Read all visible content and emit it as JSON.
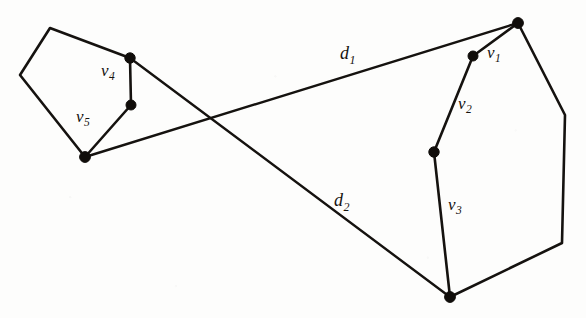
{
  "figure": {
    "background_color": "#fdfdfc",
    "ink_color": "#15120f",
    "width": 586,
    "height": 318
  },
  "chart_data": {
    "type": "diagram",
    "xlabel": "",
    "ylabel": "",
    "grid": false,
    "legend": "none",
    "xlim": [
      0,
      586
    ],
    "ylim": [
      0,
      318
    ],
    "shapes": [
      {
        "name": "left-polygon",
        "kind": "polygon",
        "closed": true,
        "points": [
          [
            50,
            28
          ],
          [
            130,
            58
          ],
          [
            131,
            105
          ],
          [
            85,
            157
          ],
          [
            20,
            75
          ]
        ]
      },
      {
        "name": "right-polygon",
        "kind": "polygon",
        "closed": true,
        "points": [
          [
            518,
            23
          ],
          [
            473,
            56
          ],
          [
            434,
            152
          ],
          [
            450,
            297
          ],
          [
            562,
            243
          ],
          [
            565,
            115
          ]
        ]
      }
    ],
    "segments": [
      {
        "name": "distance-line-d1",
        "label": "d1",
        "from": [
          85,
          157
        ],
        "to": [
          518,
          23
        ]
      },
      {
        "name": "distance-line-d2",
        "label": "d2",
        "from": [
          130,
          58
        ],
        "to": [
          450,
          297
        ]
      }
    ],
    "vertex_markers": [
      {
        "name": "marker-top-right",
        "point": [
          518,
          23
        ]
      },
      {
        "name": "marker-v1",
        "point": [
          473,
          56
        ]
      },
      {
        "name": "marker-v2-v3",
        "point": [
          434,
          152
        ]
      },
      {
        "name": "marker-bottom",
        "point": [
          450,
          297
        ]
      },
      {
        "name": "marker-v4-top",
        "point": [
          130,
          58
        ]
      },
      {
        "name": "marker-v4-v5",
        "point": [
          131,
          105
        ]
      },
      {
        "name": "marker-left-bottom",
        "point": [
          85,
          157
        ]
      }
    ],
    "annotations": [
      {
        "name": "label-d1",
        "base": "d",
        "subscript": "1",
        "text": "d₁",
        "x": 340,
        "y": 44
      },
      {
        "name": "label-d2",
        "base": "d",
        "subscript": "2",
        "text": "d₂",
        "x": 334,
        "y": 191
      },
      {
        "name": "label-v1",
        "base": "v",
        "subscript": "1",
        "text": "v₁",
        "x": 487,
        "y": 44
      },
      {
        "name": "label-v2",
        "base": "v",
        "subscript": "2",
        "text": "v₂",
        "x": 458,
        "y": 95
      },
      {
        "name": "label-v3",
        "base": "v",
        "subscript": "3",
        "text": "v₃",
        "x": 448,
        "y": 196
      },
      {
        "name": "label-v4",
        "base": "v",
        "subscript": "4",
        "text": "v₄",
        "x": 101,
        "y": 62
      },
      {
        "name": "label-v5",
        "base": "v",
        "subscript": "5",
        "text": "v₅",
        "x": 76,
        "y": 108
      }
    ]
  },
  "labels": {
    "d1": {
      "base": "d",
      "sub": "1"
    },
    "d2": {
      "base": "d",
      "sub": "2"
    },
    "v1": {
      "base": "v",
      "sub": "1"
    },
    "v2": {
      "base": "v",
      "sub": "2"
    },
    "v3": {
      "base": "v",
      "sub": "3"
    },
    "v4": {
      "base": "v",
      "sub": "4"
    },
    "v5": {
      "base": "v",
      "sub": "5"
    }
  }
}
